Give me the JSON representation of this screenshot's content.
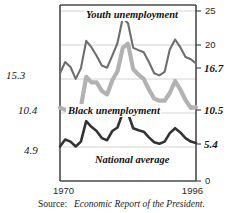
{
  "figure": {
    "source_prefix": "Source:",
    "source_italic": "Economic Report of the President."
  },
  "axes": {
    "x_start_label": "1970",
    "x_end_label": "1996",
    "y_right_ticks": [
      "25",
      "20",
      "0"
    ],
    "y_right_endpoints": [
      "16.7",
      "10.5",
      "5.4"
    ],
    "y_left_startpoints": [
      "15.3",
      "10.4",
      "4.9"
    ]
  },
  "series_labels": {
    "youth": "Youth unemployment",
    "black": "Black unemployment",
    "national": "National average"
  },
  "colors": {
    "youth": "#6e6e6e",
    "black": "#b2b2b2",
    "national": "#333333",
    "grid": "#c9c9c9",
    "frame": "#4a4a4a",
    "text": "#141414"
  },
  "chart_data": {
    "type": "line",
    "title": "",
    "xlabel": "",
    "ylabel": "",
    "xlim": [
      1970,
      1996
    ],
    "ylim": [
      0,
      25
    ],
    "grid": true,
    "yticks": [
      0,
      5,
      10,
      15,
      20,
      25
    ],
    "legend": "inline-annotations",
    "x": [
      1970,
      1971,
      1972,
      1973,
      1974,
      1975,
      1976,
      1977,
      1978,
      1979,
      1980,
      1981,
      1982,
      1983,
      1984,
      1985,
      1986,
      1987,
      1988,
      1989,
      1990,
      1991,
      1992,
      1993,
      1994,
      1995,
      1996
    ],
    "series": [
      {
        "name": "Youth unemployment",
        "color": "#6e6e6e",
        "start_value": 15.3,
        "end_value": 16.7,
        "values": [
          15.3,
          16.9,
          16.2,
          14.5,
          16.0,
          19.9,
          19.0,
          17.8,
          16.4,
          16.1,
          17.8,
          19.6,
          23.2,
          22.4,
          18.9,
          18.6,
          18.3,
          16.9,
          15.3,
          15.0,
          15.5,
          18.7,
          20.1,
          19.0,
          17.6,
          17.3,
          16.7
        ]
      },
      {
        "name": "Black unemployment",
        "color": "#b2b2b2",
        "start_value": 10.4,
        "end_value": 10.5,
        "values": [
          10.4,
          10.1,
          10.4,
          9.4,
          10.5,
          14.8,
          14.0,
          14.0,
          12.8,
          12.3,
          14.3,
          15.6,
          18.9,
          19.5,
          15.9,
          15.1,
          14.5,
          13.0,
          11.7,
          11.4,
          11.4,
          12.5,
          14.2,
          13.0,
          11.5,
          10.4,
          10.5
        ]
      },
      {
        "name": "National average",
        "color": "#333333",
        "start_value": 4.9,
        "end_value": 5.4,
        "values": [
          4.9,
          5.9,
          5.6,
          4.9,
          5.6,
          8.5,
          7.7,
          7.1,
          6.1,
          5.8,
          7.1,
          7.6,
          9.7,
          9.6,
          7.5,
          7.2,
          7.0,
          6.2,
          5.5,
          5.3,
          5.6,
          6.8,
          7.5,
          6.9,
          6.1,
          5.6,
          5.4
        ]
      }
    ]
  }
}
